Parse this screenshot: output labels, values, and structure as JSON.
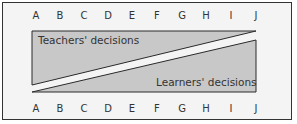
{
  "diagram": {
    "scale_letters": [
      "A",
      "B",
      "C",
      "D",
      "E",
      "F",
      "G",
      "H",
      "I",
      "J"
    ],
    "upper_region_label": "Teachers' decisions",
    "lower_region_label": "Learners' decisions",
    "colors": {
      "background": "#f4f4f4",
      "border": "#333333",
      "region_fill": "#c8c8c8",
      "region_stroke": "#2a2a2a",
      "text": "#333333"
    }
  }
}
